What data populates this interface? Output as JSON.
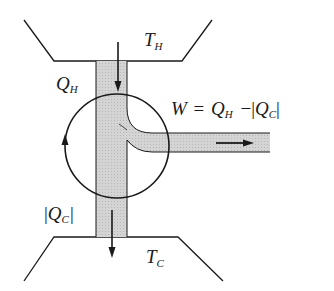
{
  "diagram": {
    "hot_reservoir": {
      "label": "T",
      "subscript": "H"
    },
    "cold_reservoir": {
      "label": "T",
      "subscript": "C"
    },
    "heat_in": {
      "label": "Q",
      "subscript": "H"
    },
    "heat_out": {
      "bar_left": "|",
      "label": "Q",
      "subscript": "C",
      "bar_right": "|"
    },
    "work_output": {
      "lhs": "W",
      "equals": "=",
      "term1": "Q",
      "term1_sub": "H",
      "minus": "−",
      "bar_left": "|",
      "term2": "Q",
      "term2_sub": "C",
      "bar_right": "|"
    },
    "colors": {
      "stroke": "#1a1a1a",
      "flow_fill": "#cfcfcf",
      "background": "#ffffff"
    }
  }
}
